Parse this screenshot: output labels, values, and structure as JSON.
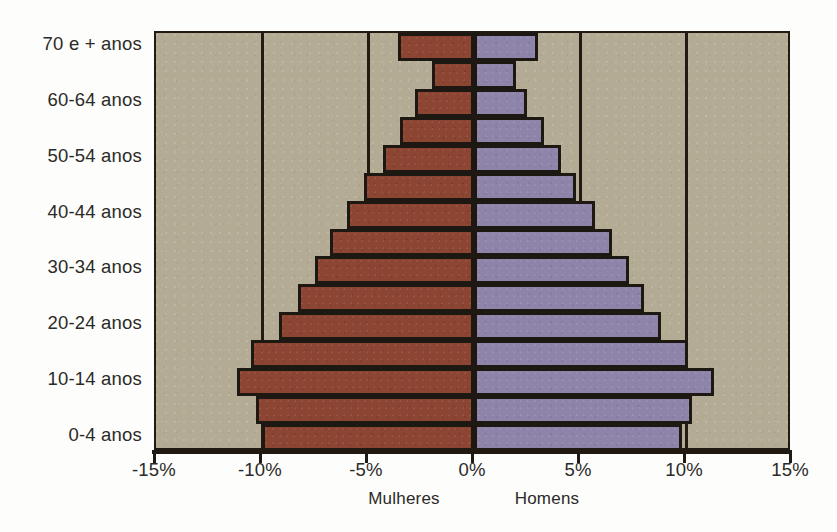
{
  "chart_data": {
    "type": "bar",
    "subtype": "population-pyramid",
    "title": "",
    "xlabel": "",
    "ylabel": "",
    "orientation": "horizontal",
    "grid": true,
    "legend_position": "below-axis",
    "xlim": [
      -15,
      15
    ],
    "xticks": [
      -15,
      -10,
      -5,
      0,
      5,
      10,
      15
    ],
    "xtick_labels": [
      "-15%",
      "-10%",
      "-5%",
      "0%",
      "5%",
      "10%",
      "15%"
    ],
    "gridline_values": [
      -10,
      -5,
      0,
      5,
      10
    ],
    "categories": [
      "70 e + anos",
      "65-69 anos",
      "60-64 anos",
      "55-59 anos",
      "50-54 anos",
      "45-49 anos",
      "40-44 anos",
      "35-39 anos",
      "30-34 anos",
      "25-29 anos",
      "20-24 anos",
      "15-19 anos",
      "10-14 anos",
      "5-9 anos",
      "0-4 anos"
    ],
    "visible_category_labels": [
      "70 e + anos",
      "60-64 anos",
      "50-54 anos",
      "40-44 anos",
      "30-34 anos",
      "20-24 anos",
      "10-14 anos",
      "0-4 anos"
    ],
    "series": [
      {
        "name": "Mulheres",
        "side": "left",
        "color": "#8c4533",
        "values": [
          -3.6,
          -2.0,
          -2.8,
          -3.5,
          -4.3,
          -5.2,
          -6.0,
          -6.8,
          -7.5,
          -8.3,
          -9.2,
          -10.5,
          -11.2,
          -10.3,
          -10.0
        ]
      },
      {
        "name": "Homens",
        "side": "right",
        "color": "#8e83a9",
        "values": [
          3.0,
          2.0,
          2.5,
          3.3,
          4.1,
          4.8,
          5.7,
          6.5,
          7.3,
          8.0,
          8.8,
          10.1,
          11.3,
          10.3,
          9.8
        ]
      }
    ]
  },
  "captions": {
    "left": "Mulheres",
    "right": "Homens"
  },
  "colors": {
    "plot_background": "#b4ab95",
    "female_bar": "#8c4533",
    "male_bar": "#8e83a9",
    "axis": "#201a13",
    "text": "#2b2a28",
    "page_background": "#fdfdfb"
  }
}
